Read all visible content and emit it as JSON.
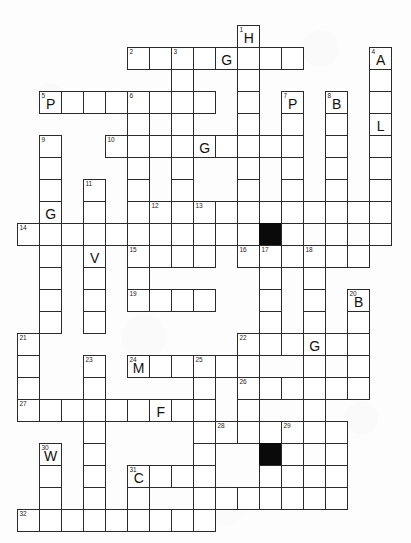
{
  "puzzle": {
    "type": "crossword-grid",
    "title": "Crossword Puzzle Grid",
    "cell_size": 22,
    "origin_x": 17,
    "origin_y": 25,
    "colors": {
      "grid_line": "#2b2b2b",
      "cell_fill": "#ffffff",
      "block_fill": "#0a0a0a",
      "page_background": "#fdfdfd",
      "text": "#111111"
    },
    "cells": [
      {
        "c": 10,
        "r": 0,
        "num": "1",
        "letter": "H"
      },
      {
        "c": 5,
        "r": 1,
        "num": "2",
        "letter": ""
      },
      {
        "c": 6,
        "r": 1,
        "num": "",
        "letter": ""
      },
      {
        "c": 7,
        "r": 1,
        "num": "3",
        "letter": ""
      },
      {
        "c": 8,
        "r": 1,
        "num": "",
        "letter": ""
      },
      {
        "c": 9,
        "r": 1,
        "num": "",
        "letter": "G"
      },
      {
        "c": 10,
        "r": 1,
        "num": "",
        "letter": ""
      },
      {
        "c": 11,
        "r": 1,
        "num": "",
        "letter": ""
      },
      {
        "c": 12,
        "r": 1,
        "num": "",
        "letter": ""
      },
      {
        "c": 16,
        "r": 1,
        "num": "4",
        "letter": "A"
      },
      {
        "c": 7,
        "r": 2,
        "num": "",
        "letter": ""
      },
      {
        "c": 10,
        "r": 2,
        "num": "",
        "letter": ""
      },
      {
        "c": 16,
        "r": 2,
        "num": "",
        "letter": ""
      },
      {
        "c": 1,
        "r": 3,
        "num": "5",
        "letter": "P"
      },
      {
        "c": 2,
        "r": 3,
        "num": "",
        "letter": ""
      },
      {
        "c": 3,
        "r": 3,
        "num": "",
        "letter": ""
      },
      {
        "c": 4,
        "r": 3,
        "num": "",
        "letter": ""
      },
      {
        "c": 5,
        "r": 3,
        "num": "6",
        "letter": ""
      },
      {
        "c": 6,
        "r": 3,
        "num": "",
        "letter": ""
      },
      {
        "c": 7,
        "r": 3,
        "num": "",
        "letter": ""
      },
      {
        "c": 8,
        "r": 3,
        "num": "",
        "letter": ""
      },
      {
        "c": 10,
        "r": 3,
        "num": "",
        "letter": ""
      },
      {
        "c": 12,
        "r": 3,
        "num": "7",
        "letter": "P"
      },
      {
        "c": 14,
        "r": 3,
        "num": "8",
        "letter": "B"
      },
      {
        "c": 16,
        "r": 3,
        "num": "",
        "letter": ""
      },
      {
        "c": 5,
        "r": 4,
        "num": "",
        "letter": ""
      },
      {
        "c": 7,
        "r": 4,
        "num": "",
        "letter": ""
      },
      {
        "c": 10,
        "r": 4,
        "num": "",
        "letter": ""
      },
      {
        "c": 12,
        "r": 4,
        "num": "",
        "letter": ""
      },
      {
        "c": 14,
        "r": 4,
        "num": "",
        "letter": ""
      },
      {
        "c": 16,
        "r": 4,
        "num": "",
        "letter": "L"
      },
      {
        "c": 1,
        "r": 5,
        "num": "9",
        "letter": ""
      },
      {
        "c": 4,
        "r": 5,
        "num": "10",
        "letter": ""
      },
      {
        "c": 5,
        "r": 5,
        "num": "",
        "letter": ""
      },
      {
        "c": 6,
        "r": 5,
        "num": "",
        "letter": ""
      },
      {
        "c": 7,
        "r": 5,
        "num": "",
        "letter": ""
      },
      {
        "c": 8,
        "r": 5,
        "num": "",
        "letter": "G"
      },
      {
        "c": 9,
        "r": 5,
        "num": "",
        "letter": ""
      },
      {
        "c": 10,
        "r": 5,
        "num": "",
        "letter": ""
      },
      {
        "c": 11,
        "r": 5,
        "num": "",
        "letter": ""
      },
      {
        "c": 12,
        "r": 5,
        "num": "",
        "letter": ""
      },
      {
        "c": 14,
        "r": 5,
        "num": "",
        "letter": ""
      },
      {
        "c": 16,
        "r": 5,
        "num": "",
        "letter": ""
      },
      {
        "c": 1,
        "r": 6,
        "num": "",
        "letter": ""
      },
      {
        "c": 5,
        "r": 6,
        "num": "",
        "letter": ""
      },
      {
        "c": 7,
        "r": 6,
        "num": "",
        "letter": ""
      },
      {
        "c": 10,
        "r": 6,
        "num": "",
        "letter": ""
      },
      {
        "c": 12,
        "r": 6,
        "num": "",
        "letter": ""
      },
      {
        "c": 14,
        "r": 6,
        "num": "",
        "letter": ""
      },
      {
        "c": 16,
        "r": 6,
        "num": "",
        "letter": ""
      },
      {
        "c": 1,
        "r": 7,
        "num": "",
        "letter": ""
      },
      {
        "c": 3,
        "r": 7,
        "num": "11",
        "letter": ""
      },
      {
        "c": 5,
        "r": 7,
        "num": "",
        "letter": ""
      },
      {
        "c": 7,
        "r": 7,
        "num": "",
        "letter": ""
      },
      {
        "c": 10,
        "r": 7,
        "num": "",
        "letter": ""
      },
      {
        "c": 12,
        "r": 7,
        "num": "",
        "letter": ""
      },
      {
        "c": 14,
        "r": 7,
        "num": "",
        "letter": ""
      },
      {
        "c": 16,
        "r": 7,
        "num": "",
        "letter": ""
      },
      {
        "c": 1,
        "r": 8,
        "num": "",
        "letter": "G"
      },
      {
        "c": 3,
        "r": 8,
        "num": "",
        "letter": ""
      },
      {
        "c": 5,
        "r": 8,
        "num": "",
        "letter": ""
      },
      {
        "c": 6,
        "r": 8,
        "num": "12",
        "letter": ""
      },
      {
        "c": 7,
        "r": 8,
        "num": "",
        "letter": ""
      },
      {
        "c": 8,
        "r": 8,
        "num": "13",
        "letter": ""
      },
      {
        "c": 9,
        "r": 8,
        "num": "",
        "letter": ""
      },
      {
        "c": 10,
        "r": 8,
        "num": "",
        "letter": ""
      },
      {
        "c": 11,
        "r": 8,
        "num": "",
        "letter": ""
      },
      {
        "c": 12,
        "r": 8,
        "num": "",
        "letter": ""
      },
      {
        "c": 13,
        "r": 8,
        "num": "",
        "letter": ""
      },
      {
        "c": 14,
        "r": 8,
        "num": "",
        "letter": ""
      },
      {
        "c": 15,
        "r": 8,
        "num": "",
        "letter": ""
      },
      {
        "c": 16,
        "r": 8,
        "num": "",
        "letter": ""
      },
      {
        "c": 0,
        "r": 9,
        "num": "14",
        "letter": ""
      },
      {
        "c": 1,
        "r": 9,
        "num": "",
        "letter": ""
      },
      {
        "c": 2,
        "r": 9,
        "num": "",
        "letter": ""
      },
      {
        "c": 3,
        "r": 9,
        "num": "",
        "letter": ""
      },
      {
        "c": 4,
        "r": 9,
        "num": "",
        "letter": ""
      },
      {
        "c": 5,
        "r": 9,
        "num": "",
        "letter": ""
      },
      {
        "c": 6,
        "r": 9,
        "num": "",
        "letter": ""
      },
      {
        "c": 7,
        "r": 9,
        "num": "",
        "letter": ""
      },
      {
        "c": 8,
        "r": 9,
        "num": "",
        "letter": ""
      },
      {
        "c": 9,
        "r": 9,
        "num": "",
        "letter": ""
      },
      {
        "c": 10,
        "r": 9,
        "num": "",
        "letter": ""
      },
      {
        "c": 11,
        "r": 9,
        "num": "",
        "letter": "",
        "block": true
      },
      {
        "c": 12,
        "r": 9,
        "num": "",
        "letter": ""
      },
      {
        "c": 14,
        "r": 9,
        "num": "",
        "letter": ""
      },
      {
        "c": 16,
        "r": 9,
        "num": "",
        "letter": ""
      },
      {
        "c": 1,
        "r": 10,
        "num": "",
        "letter": ""
      },
      {
        "c": 3,
        "r": 10,
        "num": "",
        "letter": "V"
      },
      {
        "c": 5,
        "r": 10,
        "num": "15",
        "letter": ""
      },
      {
        "c": 6,
        "r": 10,
        "num": "",
        "letter": ""
      },
      {
        "c": 7,
        "r": 10,
        "num": "",
        "letter": ""
      },
      {
        "c": 8,
        "r": 10,
        "num": "",
        "letter": ""
      },
      {
        "c": 10,
        "r": 10,
        "num": "16",
        "letter": ""
      },
      {
        "c": 11,
        "r": 10,
        "num": "17",
        "letter": ""
      },
      {
        "c": 12,
        "r": 10,
        "num": "",
        "letter": ""
      },
      {
        "c": 13,
        "r": 10,
        "num": "18",
        "letter": ""
      },
      {
        "c": 14,
        "r": 10,
        "num": "",
        "letter": ""
      },
      {
        "c": 15,
        "r": 10,
        "num": "",
        "letter": ""
      },
      {
        "c": 1,
        "r": 11,
        "num": "",
        "letter": ""
      },
      {
        "c": 3,
        "r": 11,
        "num": "",
        "letter": ""
      },
      {
        "c": 5,
        "r": 11,
        "num": "",
        "letter": ""
      },
      {
        "c": 11,
        "r": 11,
        "num": "",
        "letter": ""
      },
      {
        "c": 13,
        "r": 11,
        "num": "",
        "letter": ""
      },
      {
        "c": 1,
        "r": 12,
        "num": "",
        "letter": ""
      },
      {
        "c": 3,
        "r": 12,
        "num": "",
        "letter": ""
      },
      {
        "c": 5,
        "r": 12,
        "num": "19",
        "letter": ""
      },
      {
        "c": 6,
        "r": 12,
        "num": "",
        "letter": ""
      },
      {
        "c": 7,
        "r": 12,
        "num": "",
        "letter": ""
      },
      {
        "c": 8,
        "r": 12,
        "num": "",
        "letter": ""
      },
      {
        "c": 11,
        "r": 12,
        "num": "",
        "letter": ""
      },
      {
        "c": 13,
        "r": 12,
        "num": "",
        "letter": ""
      },
      {
        "c": 15,
        "r": 12,
        "num": "20",
        "letter": "B"
      },
      {
        "c": 1,
        "r": 13,
        "num": "",
        "letter": ""
      },
      {
        "c": 3,
        "r": 13,
        "num": "",
        "letter": ""
      },
      {
        "c": 11,
        "r": 13,
        "num": "",
        "letter": ""
      },
      {
        "c": 13,
        "r": 13,
        "num": "",
        "letter": ""
      },
      {
        "c": 15,
        "r": 13,
        "num": "",
        "letter": ""
      },
      {
        "c": 0,
        "r": 14,
        "num": "21",
        "letter": ""
      },
      {
        "c": 10,
        "r": 14,
        "num": "22",
        "letter": ""
      },
      {
        "c": 11,
        "r": 14,
        "num": "",
        "letter": ""
      },
      {
        "c": 12,
        "r": 14,
        "num": "",
        "letter": ""
      },
      {
        "c": 13,
        "r": 14,
        "num": "",
        "letter": "G"
      },
      {
        "c": 14,
        "r": 14,
        "num": "",
        "letter": ""
      },
      {
        "c": 15,
        "r": 14,
        "num": "",
        "letter": ""
      },
      {
        "c": 0,
        "r": 15,
        "num": "",
        "letter": ""
      },
      {
        "c": 3,
        "r": 15,
        "num": "23",
        "letter": ""
      },
      {
        "c": 5,
        "r": 15,
        "num": "24",
        "letter": "M"
      },
      {
        "c": 6,
        "r": 15,
        "num": "",
        "letter": ""
      },
      {
        "c": 7,
        "r": 15,
        "num": "",
        "letter": ""
      },
      {
        "c": 8,
        "r": 15,
        "num": "25",
        "letter": ""
      },
      {
        "c": 9,
        "r": 15,
        "num": "",
        "letter": ""
      },
      {
        "c": 10,
        "r": 15,
        "num": "",
        "letter": ""
      },
      {
        "c": 13,
        "r": 15,
        "num": "",
        "letter": ""
      },
      {
        "c": 15,
        "r": 15,
        "num": "",
        "letter": ""
      },
      {
        "c": 0,
        "r": 16,
        "num": "",
        "letter": ""
      },
      {
        "c": 3,
        "r": 16,
        "num": "",
        "letter": ""
      },
      {
        "c": 8,
        "r": 16,
        "num": "",
        "letter": ""
      },
      {
        "c": 10,
        "r": 16,
        "num": "26",
        "letter": ""
      },
      {
        "c": 11,
        "r": 16,
        "num": "",
        "letter": ""
      },
      {
        "c": 12,
        "r": 16,
        "num": "",
        "letter": ""
      },
      {
        "c": 13,
        "r": 16,
        "num": "",
        "letter": ""
      },
      {
        "c": 14,
        "r": 16,
        "num": "",
        "letter": ""
      },
      {
        "c": 15,
        "r": 16,
        "num": "",
        "letter": ""
      },
      {
        "c": 0,
        "r": 17,
        "num": "27",
        "letter": ""
      },
      {
        "c": 1,
        "r": 17,
        "num": "",
        "letter": ""
      },
      {
        "c": 2,
        "r": 17,
        "num": "",
        "letter": ""
      },
      {
        "c": 3,
        "r": 17,
        "num": "",
        "letter": ""
      },
      {
        "c": 4,
        "r": 17,
        "num": "",
        "letter": ""
      },
      {
        "c": 5,
        "r": 17,
        "num": "",
        "letter": ""
      },
      {
        "c": 6,
        "r": 17,
        "num": "",
        "letter": "F"
      },
      {
        "c": 7,
        "r": 17,
        "num": "",
        "letter": ""
      },
      {
        "c": 8,
        "r": 17,
        "num": "",
        "letter": ""
      },
      {
        "c": 10,
        "r": 17,
        "num": "",
        "letter": ""
      },
      {
        "c": 13,
        "r": 17,
        "num": "",
        "letter": ""
      },
      {
        "c": 3,
        "r": 18,
        "num": "",
        "letter": ""
      },
      {
        "c": 8,
        "r": 18,
        "num": "",
        "letter": ""
      },
      {
        "c": 9,
        "r": 18,
        "num": "28",
        "letter": ""
      },
      {
        "c": 10,
        "r": 18,
        "num": "",
        "letter": ""
      },
      {
        "c": 11,
        "r": 18,
        "num": "",
        "letter": ""
      },
      {
        "c": 12,
        "r": 18,
        "num": "29",
        "letter": ""
      },
      {
        "c": 13,
        "r": 18,
        "num": "",
        "letter": ""
      },
      {
        "c": 14,
        "r": 18,
        "num": "",
        "letter": ""
      },
      {
        "c": 1,
        "r": 19,
        "num": "30",
        "letter": "W"
      },
      {
        "c": 3,
        "r": 19,
        "num": "",
        "letter": ""
      },
      {
        "c": 8,
        "r": 19,
        "num": "",
        "letter": ""
      },
      {
        "c": 11,
        "r": 19,
        "num": "",
        "letter": "",
        "block": true
      },
      {
        "c": 12,
        "r": 19,
        "num": "",
        "letter": ""
      },
      {
        "c": 14,
        "r": 19,
        "num": "",
        "letter": ""
      },
      {
        "c": 1,
        "r": 20,
        "num": "",
        "letter": ""
      },
      {
        "c": 3,
        "r": 20,
        "num": "",
        "letter": ""
      },
      {
        "c": 5,
        "r": 20,
        "num": "31",
        "letter": "C"
      },
      {
        "c": 6,
        "r": 20,
        "num": "",
        "letter": ""
      },
      {
        "c": 7,
        "r": 20,
        "num": "",
        "letter": ""
      },
      {
        "c": 8,
        "r": 20,
        "num": "",
        "letter": ""
      },
      {
        "c": 11,
        "r": 20,
        "num": "",
        "letter": ""
      },
      {
        "c": 12,
        "r": 20,
        "num": "",
        "letter": ""
      },
      {
        "c": 13,
        "r": 20,
        "num": "",
        "letter": ""
      },
      {
        "c": 14,
        "r": 20,
        "num": "",
        "letter": ""
      },
      {
        "c": 1,
        "r": 21,
        "num": "",
        "letter": ""
      },
      {
        "c": 3,
        "r": 21,
        "num": "",
        "letter": ""
      },
      {
        "c": 5,
        "r": 21,
        "num": "",
        "letter": ""
      },
      {
        "c": 8,
        "r": 21,
        "num": "",
        "letter": ""
      },
      {
        "c": 9,
        "r": 21,
        "num": "",
        "letter": ""
      },
      {
        "c": 10,
        "r": 21,
        "num": "",
        "letter": ""
      },
      {
        "c": 11,
        "r": 21,
        "num": "",
        "letter": ""
      },
      {
        "c": 12,
        "r": 21,
        "num": "",
        "letter": ""
      },
      {
        "c": 13,
        "r": 21,
        "num": "",
        "letter": ""
      },
      {
        "c": 14,
        "r": 21,
        "num": "",
        "letter": ""
      },
      {
        "c": 0,
        "r": 22,
        "num": "32",
        "letter": ""
      },
      {
        "c": 1,
        "r": 22,
        "num": "",
        "letter": ""
      },
      {
        "c": 2,
        "r": 22,
        "num": "",
        "letter": ""
      },
      {
        "c": 3,
        "r": 22,
        "num": "",
        "letter": ""
      },
      {
        "c": 4,
        "r": 22,
        "num": "",
        "letter": ""
      },
      {
        "c": 5,
        "r": 22,
        "num": "",
        "letter": ""
      },
      {
        "c": 6,
        "r": 22,
        "num": "",
        "letter": ""
      },
      {
        "c": 7,
        "r": 22,
        "num": "",
        "letter": ""
      },
      {
        "c": 8,
        "r": 22,
        "num": "",
        "letter": ""
      }
    ]
  }
}
